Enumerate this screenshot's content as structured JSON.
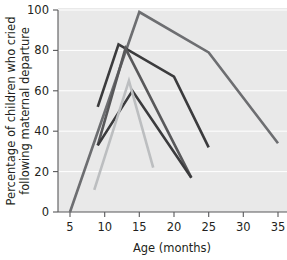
{
  "chart_data": {
    "type": "line",
    "title": "",
    "xlabel": "Age (months)",
    "ylabel": "Percentage of children who cried following maternal departure",
    "xlim": [
      3,
      37
    ],
    "ylim": [
      0,
      100
    ],
    "xticks": [
      5,
      10,
      15,
      20,
      25,
      30,
      35
    ],
    "yticks": [
      0,
      20,
      40,
      60,
      80,
      100
    ],
    "xtick_labels": [
      "5",
      "10",
      "15",
      "20",
      "25",
      "30",
      "35"
    ],
    "ytick_labels": [
      "0",
      "20",
      "40",
      "60",
      "80",
      "100"
    ],
    "grid": true,
    "grid_axis": "y",
    "grid_color": "#ffffff",
    "plot_background": "#e9e9e9",
    "legend": "none",
    "series": [
      {
        "name": "series-1",
        "color": "#6d6e71",
        "x": [
          5,
          15,
          25,
          35
        ],
        "y": [
          0,
          99,
          79,
          34
        ]
      },
      {
        "name": "series-2",
        "color": "#3b3b3d",
        "x": [
          9,
          12,
          20,
          25
        ],
        "y": [
          52,
          83,
          67,
          32
        ]
      },
      {
        "name": "series-3",
        "color": "#58585a",
        "x": [
          9,
          13,
          22.5
        ],
        "y": [
          33,
          81,
          17
        ]
      },
      {
        "name": "series-4",
        "color": "#3b3b3d",
        "x": [
          9,
          14,
          22.5
        ],
        "y": [
          33,
          60,
          17
        ]
      },
      {
        "name": "series-5",
        "color": "#bcbec0",
        "x": [
          8.5,
          13.5,
          17
        ],
        "y": [
          11,
          65,
          22
        ]
      }
    ]
  },
  "labels": {
    "ylabel_line1": "Percentage of children who cried",
    "ylabel_line2": "following maternal departure",
    "xlabel": "Age (months)"
  }
}
